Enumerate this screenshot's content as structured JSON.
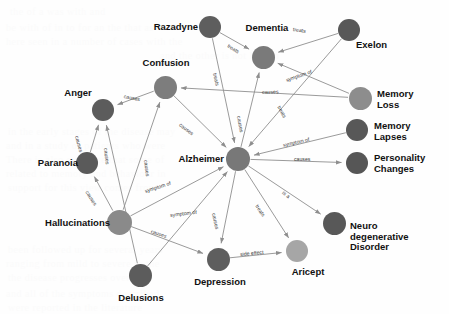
{
  "diagram": {
    "type": "node-link-graph",
    "width": 449,
    "height": 314,
    "background_color": "#fefefe"
  },
  "palette": {
    "node_dark": "#5a5a5a",
    "node_mid": "#6e6e6e",
    "node_light": "#8c8c8c",
    "node_lightest": "#a9a9a9",
    "edge": "#8e8e8e",
    "label_text": "#111111",
    "edge_text": "#3a3a3a"
  },
  "nodes": [
    {
      "id": "razadyne",
      "label": "Razadyne",
      "x": 210,
      "y": 27,
      "r": 11,
      "color": "#5e5e5e",
      "label_x": 148,
      "label_y": 22,
      "label_align": "nl-left",
      "label_w": 50
    },
    {
      "id": "dementia",
      "label": "Dementia",
      "x": 263,
      "y": 57,
      "r": 11.5,
      "color": "#7a7a7a",
      "label_x": 241,
      "label_y": 23,
      "label_align": "nl-center",
      "label_w": 52
    },
    {
      "id": "exelon",
      "label": "Exelon",
      "x": 349,
      "y": 30,
      "r": 11,
      "color": "#585858",
      "label_x": 356,
      "label_y": 40,
      "label_align": "nl-right",
      "label_w": 45
    },
    {
      "id": "confusion",
      "label": "Confusion",
      "x": 165,
      "y": 87,
      "r": 11.5,
      "color": "#7d7d7d",
      "label_x": 137,
      "label_y": 58,
      "label_align": "nl-center",
      "label_w": 58
    },
    {
      "id": "anger",
      "label": "Anger",
      "x": 103,
      "y": 110,
      "r": 11,
      "color": "#5c5c5c",
      "label_x": 57,
      "label_y": 88,
      "label_align": "nl-center",
      "label_w": 42
    },
    {
      "id": "memory_loss",
      "label": "Memory\nLoss",
      "x": 360,
      "y": 98,
      "r": 11.5,
      "color": "#8d8d8d",
      "label_x": 377,
      "label_y": 89,
      "label_align": "nl-right",
      "label_w": 62
    },
    {
      "id": "memory_laps",
      "label": "Memory\nLapses",
      "x": 357,
      "y": 130,
      "r": 11,
      "color": "#585858",
      "label_x": 374,
      "label_y": 121,
      "label_align": "nl-right",
      "label_w": 62
    },
    {
      "id": "paranoia",
      "label": "Paranoia",
      "x": 87,
      "y": 163,
      "r": 11,
      "color": "#5a5a5a",
      "label_x": 26,
      "label_y": 158,
      "label_align": "nl-left",
      "label_w": 52
    },
    {
      "id": "alzheimer",
      "label": "Alzheimer",
      "x": 238,
      "y": 159,
      "r": 12,
      "color": "#787878",
      "label_x": 166,
      "label_y": 154,
      "label_align": "nl-left",
      "label_w": 58
    },
    {
      "id": "personality",
      "label": "Personality\nChanges",
      "x": 357,
      "y": 163,
      "r": 11,
      "color": "#565656",
      "label_x": 374,
      "label_y": 153,
      "label_align": "nl-right",
      "label_w": 66
    },
    {
      "id": "halluc",
      "label": "Hallucinations",
      "x": 119,
      "y": 222,
      "r": 12.5,
      "color": "#8a8a8a",
      "label_x": 28,
      "label_y": 218,
      "label_align": "nl-left",
      "label_w": 82
    },
    {
      "id": "neuro",
      "label": "Neuro\ndegenerative\nDisorder",
      "x": 334,
      "y": 223,
      "r": 11.5,
      "color": "#585858",
      "label_x": 350,
      "label_y": 221,
      "label_align": "nl-right",
      "label_w": 72
    },
    {
      "id": "aricept",
      "label": "Aricept",
      "x": 297,
      "y": 251,
      "r": 11,
      "color": "#a6a6a6",
      "label_x": 285,
      "label_y": 267,
      "label_align": "nl-center",
      "label_w": 46
    },
    {
      "id": "depression",
      "label": "Depression",
      "x": 218,
      "y": 259,
      "r": 11.5,
      "color": "#5e5e5e",
      "label_x": 189,
      "label_y": 277,
      "label_align": "nl-center",
      "label_w": 62
    },
    {
      "id": "delusions",
      "label": "Delusions",
      "x": 140,
      "y": 275,
      "r": 11.5,
      "color": "#5c5c5c",
      "label_x": 112,
      "label_y": 293,
      "label_align": "nl-center",
      "label_w": 58
    }
  ],
  "edges": [
    {
      "from": "razadyne",
      "to": "dementia",
      "label": "treats",
      "lx": 228,
      "ly": 42,
      "rot": 33
    },
    {
      "from": "exelon",
      "to": "dementia",
      "label": "treats",
      "lx": 293,
      "ly": 26,
      "rot": 8
    },
    {
      "from": "razadyne",
      "to": "alzheimer",
      "label": "treats",
      "lx": 215,
      "ly": 70,
      "rot": 78
    },
    {
      "from": "exelon",
      "to": "alzheimer",
      "label": "treats",
      "lx": 279,
      "ly": 103,
      "rot": 61
    },
    {
      "from": "memory_loss",
      "to": "dementia",
      "label": "symptom of",
      "lx": 286,
      "ly": 77,
      "rot": -19
    },
    {
      "from": "memory_loss",
      "to": "confusion",
      "label": "causes",
      "lx": 262,
      "ly": 89,
      "rot": -2
    },
    {
      "from": "memory_laps",
      "to": "alzheimer",
      "label": "symptom of",
      "lx": 283,
      "ly": 142,
      "rot": -13
    },
    {
      "from": "alzheimer",
      "to": "personality",
      "label": "causes",
      "lx": 294,
      "ly": 156,
      "rot": 0
    },
    {
      "from": "confusion",
      "to": "anger",
      "label": "causes",
      "lx": 124,
      "ly": 93,
      "rot": 12
    },
    {
      "from": "confusion",
      "to": "alzheimer",
      "label": "causes",
      "lx": 180,
      "ly": 121,
      "rot": 37
    },
    {
      "from": "alzheimer",
      "to": "dementia",
      "label": "causes",
      "lx": 239,
      "ly": 113,
      "rot": 80
    },
    {
      "from": "paranoia",
      "to": "anger",
      "label": "causes",
      "lx": 77,
      "ly": 133,
      "rot": 75
    },
    {
      "from": "delusions",
      "to": "anger",
      "label": "causes",
      "lx": 106,
      "ly": 145,
      "rot": 84
    },
    {
      "from": "halluc",
      "to": "paranoia",
      "label": "causes",
      "lx": 87,
      "ly": 188,
      "rot": 58
    },
    {
      "from": "halluc",
      "to": "confusion",
      "label": "causes",
      "lx": 146,
      "ly": 157,
      "rot": 83
    },
    {
      "from": "halluc",
      "to": "alzheimer",
      "label": "symptom of",
      "lx": 145,
      "ly": 188,
      "rot": -18
    },
    {
      "from": "halluc",
      "to": "depression",
      "label": "causes",
      "lx": 151,
      "ly": 228,
      "rot": 18
    },
    {
      "from": "delusions",
      "to": "alzheimer",
      "label": "symptom of",
      "lx": 170,
      "ly": 212,
      "rot": -7
    },
    {
      "from": "alzheimer",
      "to": "depression",
      "label": "causes",
      "lx": 214,
      "ly": 210,
      "rot": 78
    },
    {
      "from": "alzheimer",
      "to": "aricept",
      "label": "treats",
      "lx": 257,
      "ly": 202,
      "rot": 57
    },
    {
      "from": "alzheimer",
      "to": "neuro",
      "label": "is a",
      "lx": 283,
      "ly": 189,
      "rot": 36
    },
    {
      "from": "depression",
      "to": "aricept",
      "label": "side effect",
      "lx": 240,
      "ly": 251,
      "rot": -5
    }
  ],
  "background_bleed": [
    {
      "text": "the  of  a  was  with  and",
      "x": 10,
      "y": 6
    },
    {
      "text": "be with of  in  to  for  an  the  that  as",
      "x": 6,
      "y": 22
    },
    {
      "text": "here  seen in a  number of  cases  with  the",
      "x": 6,
      "y": 36
    },
    {
      "text": "and  the  other  is  not  known",
      "x": 160,
      "y": 50
    },
    {
      "text": "in  the  early  stages  of  the  disease  may",
      "x": 8,
      "y": 126
    },
    {
      "text": "and  in  a  study  of  patients  who  were",
      "x": 6,
      "y": 140
    },
    {
      "text": "There  is  also  evidence  that  some  of",
      "x": 6,
      "y": 154
    },
    {
      "text": "related  to  memory  and  behaviour  in",
      "x": 6,
      "y": 168
    },
    {
      "text": "support  for  this  view  comes  from",
      "x": 8,
      "y": 182
    },
    {
      "text": "been  followed  up  for  several  years",
      "x": 8,
      "y": 244
    },
    {
      "text": "ranging  from  mild  to  severe  in  the",
      "x": 6,
      "y": 258
    },
    {
      "text": "the  disease  progresses  over  time",
      "x": 8,
      "y": 272
    },
    {
      "text": "and  all  of  the  symptoms  described",
      "x": 6,
      "y": 288
    },
    {
      "text": "were  reported  in  the  literature",
      "x": 8,
      "y": 302
    }
  ]
}
